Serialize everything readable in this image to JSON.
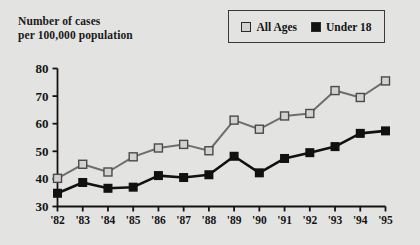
{
  "axis_title": "Number of cases\nper 100,000 population",
  "legend": {
    "position": "top-right",
    "entries": [
      {
        "label": "All Ages",
        "swatch_name": "legend-swatch-all-ages",
        "color": "#d2d2d2"
      },
      {
        "label": "Under 18",
        "swatch_name": "legend-swatch-under-18",
        "color": "#111111"
      }
    ]
  },
  "chart_data": {
    "type": "line",
    "title": "",
    "subtitle": "",
    "xlabel": "",
    "ylabel": "Number of cases per 100,000 population",
    "x": [
      "'82",
      "'83",
      "'84",
      "'85",
      "'86",
      "'87",
      "'88",
      "'89",
      "'90",
      "'91",
      "'92",
      "'93",
      "'94",
      "'95"
    ],
    "categories": [
      "'82",
      "'83",
      "'84",
      "'85",
      "'86",
      "'87",
      "'88",
      "'89",
      "'90",
      "'91",
      "'92",
      "'93",
      "'94",
      "'95"
    ],
    "series": [
      {
        "name": "All Ages",
        "color": "#d2d2d2",
        "line_color": "#6e6e6e",
        "marker": "square",
        "values": [
          40.2,
          45.3,
          42.5,
          48.0,
          51.2,
          52.5,
          50.2,
          61.3,
          58.0,
          62.8,
          63.7,
          72.0,
          69.5,
          75.5
        ]
      },
      {
        "name": "Under 18",
        "color": "#111111",
        "line_color": "#111111",
        "marker": "square",
        "values": [
          34.8,
          38.7,
          36.6,
          37.0,
          41.2,
          40.5,
          41.5,
          48.2,
          42.2,
          47.4,
          49.5,
          51.7,
          56.5,
          57.4
        ]
      }
    ],
    "ylim": [
      30,
      80
    ],
    "yticks": [
      30,
      40,
      50,
      60,
      70,
      80
    ],
    "ytick_labels": [
      "30",
      "40",
      "50",
      "60",
      "70",
      "80"
    ],
    "xtick_labels": [
      "'82",
      "'83",
      "'84",
      "'85",
      "'86",
      "'87",
      "'88",
      "'89",
      "'90",
      "'91",
      "'92",
      "'93",
      "'94",
      "'95"
    ],
    "grid": false,
    "legend_position": "top-right",
    "background_color": "#e3e3e1",
    "axis_color": "#141414"
  }
}
